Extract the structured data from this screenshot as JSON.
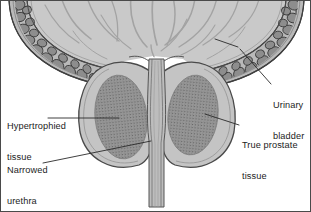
{
  "figure": {
    "background_color": "#ffffff",
    "border_color": "#4a4a4a",
    "text_color": "#1c1c1c"
  },
  "palette": {
    "bladder_lumen_fill": "#c9c9c9",
    "bladder_rugae_line": "#9a9a9a",
    "bladder_wall_pebble_fill": "#8d8d8d",
    "bladder_wall_pebble_stroke": "#3a3a3a",
    "bladder_wall_band_fill": "#bdbdbd",
    "prostate_fill": "#c4c4c4",
    "prostate_stroke": "#4a4a4a",
    "hypertrophied_fill": "#9e9e9e",
    "hypertrophied_stipple": "#5a5a5a",
    "urethra_fill": "#bdbdbd",
    "urethra_stroke": "#555555",
    "leader_line": "#2a2a2a"
  },
  "labels": [
    {
      "id": "hypertrophied-tissue",
      "line1": "Hypertrophied",
      "line2": "tissue",
      "side": "left",
      "x": 6,
      "y": 99,
      "leader": {
        "from_x": 47,
        "from_y": 117,
        "to_x": 118,
        "to_y": 117
      }
    },
    {
      "id": "narrowed-urethra",
      "line1": "Narrowed",
      "line2": "urethra",
      "side": "left",
      "x": 6,
      "y": 143,
      "leader": {
        "from_x": 42,
        "from_y": 162,
        "to_x": 150,
        "to_y": 140
      }
    },
    {
      "id": "urinary-bladder",
      "line1": "Urinary",
      "line2": "bladder",
      "side": "right",
      "x": 272,
      "y": 85,
      "leader": {
        "from_x": 270,
        "from_y": 83,
        "to_x": 239,
        "to_y": 48
      }
    },
    {
      "id": "true-prostate-tissue",
      "line1": "True prostate",
      "line2": "tissue",
      "side": "right",
      "x": 240,
      "y": 120,
      "leader": {
        "from_x": 238,
        "from_y": 124,
        "to_x": 204,
        "to_y": 113
      }
    }
  ],
  "structures": [
    {
      "id": "urinary-bladder-lumen",
      "name": "Urinary bladder lumen"
    },
    {
      "id": "bladder-wall",
      "name": "Bladder muscular wall (detrusor bundles)"
    },
    {
      "id": "prostate-left-lobe",
      "name": "Left prostatic lobe"
    },
    {
      "id": "prostate-right-lobe",
      "name": "Right prostatic lobe"
    },
    {
      "id": "hypertrophied-mass-left",
      "name": "Hypertrophied tissue, left lobe"
    },
    {
      "id": "hypertrophied-mass-right",
      "name": "Hypertrophied tissue, right lobe"
    },
    {
      "id": "narrowed-urethra-channel",
      "name": "Narrowed prostatic urethra"
    }
  ]
}
